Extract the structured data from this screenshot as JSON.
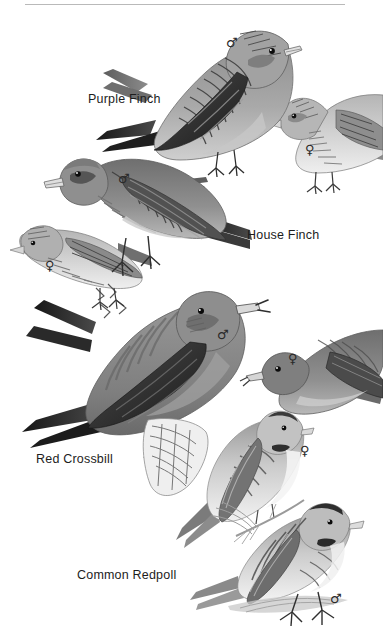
{
  "page": {
    "type": "field-guide-plate",
    "background_color": "#ffffff",
    "width": 383,
    "height": 644,
    "rule_color": "#b9b9b9",
    "ink_color": "#1d1d1d",
    "style": "grayscale bird illustration plate"
  },
  "species": [
    {
      "id": "purple-finch",
      "label": "Purple Finch",
      "label_x": 88,
      "label_y": 92,
      "marks": [
        {
          "sex": "male",
          "glyph": "♂",
          "x": 226,
          "y": 36
        },
        {
          "sex": "female",
          "glyph": "♀",
          "x": 305,
          "y": 143
        }
      ]
    },
    {
      "id": "house-finch",
      "label": "House Finch",
      "label_x": 247,
      "label_y": 228,
      "marks": [
        {
          "sex": "male",
          "glyph": "♂",
          "x": 118,
          "y": 172
        },
        {
          "sex": "female",
          "glyph": "♀",
          "x": 45,
          "y": 259
        }
      ]
    },
    {
      "id": "red-crossbill",
      "label": "Red Crossbill",
      "label_x": 36,
      "label_y": 452,
      "marks": [
        {
          "sex": "male",
          "glyph": "♂",
          "x": 217,
          "y": 328
        },
        {
          "sex": "female",
          "glyph": "♀",
          "x": 288,
          "y": 352
        }
      ]
    },
    {
      "id": "common-redpoll",
      "label": "Common Redpoll",
      "label_x": 77,
      "label_y": 568,
      "marks": [
        {
          "sex": "female",
          "glyph": "♀",
          "x": 300,
          "y": 444
        },
        {
          "sex": "male",
          "glyph": "♂",
          "x": 330,
          "y": 592
        }
      ]
    }
  ],
  "icons": {
    "male": "♂",
    "female": "♀"
  }
}
